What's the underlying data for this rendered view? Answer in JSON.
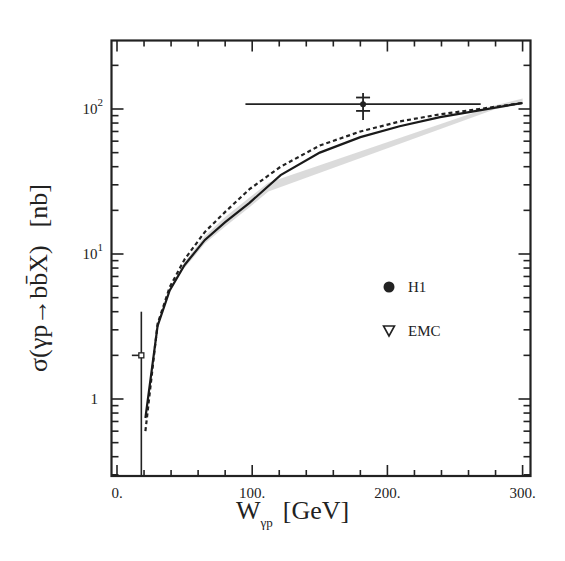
{
  "chart_data": {
    "type": "line",
    "title": "",
    "xlabel": "W_γp [GeV]",
    "xlabel_main": "W",
    "xlabel_sub": "γp",
    "xlabel_unit": "[GeV]",
    "ylabel": "σ(γp→bb̄X) [nb]",
    "ylabel_main": "σ(γp→bb̄X)",
    "ylabel_unit": "[nb]",
    "xlim": [
      -4,
      307
    ],
    "ylim": [
      0.3,
      300
    ],
    "yscale": "log",
    "grid": false,
    "x_ticks": [
      {
        "value": 0,
        "label": "0."
      },
      {
        "value": 100,
        "label": "100."
      },
      {
        "value": 200,
        "label": "200."
      },
      {
        "value": 300,
        "label": "300."
      }
    ],
    "y_ticks": [
      {
        "value": 1,
        "label": "1",
        "exp": ""
      },
      {
        "value": 10,
        "label": "10",
        "exp": "1"
      },
      {
        "value": 100,
        "label": "10",
        "exp": "2"
      }
    ],
    "legend": {
      "position": "lower right inside",
      "entries": [
        {
          "label": "H1",
          "marker": "filled-circle"
        },
        {
          "label": "EMC",
          "marker": "open-triangle-down"
        }
      ]
    },
    "series": [
      {
        "name": "theory (solid)",
        "style": "solid",
        "x": [
          21,
          30,
          39,
          50,
          65,
          80,
          98,
          121,
          150,
          180,
          209,
          239,
          268,
          300
        ],
        "y": [
          0.74,
          3.2,
          5.6,
          8.4,
          12.5,
          16.6,
          22.5,
          35,
          50,
          64,
          76,
          88,
          98,
          110
        ]
      },
      {
        "name": "theory (dashed)",
        "style": "dashed",
        "x": [
          21,
          30,
          39,
          50,
          65,
          80,
          98,
          121,
          150,
          180,
          209,
          239,
          268,
          300
        ],
        "y": [
          0.6,
          3.3,
          5.9,
          9.2,
          14.2,
          19.5,
          28,
          40,
          56,
          70,
          82,
          92,
          100,
          110
        ]
      },
      {
        "name": "theory uncertainty band (shaded)",
        "style": "band",
        "x": [
          50,
          65,
          80,
          98,
          112,
          280,
          300
        ],
        "y_low": [
          8.0,
          11.8,
          15.5,
          21.0,
          27.0,
          100,
          108
        ],
        "y_high": [
          8.8,
          13.3,
          18.0,
          24.5,
          31.0,
          106,
          118
        ]
      }
    ],
    "points": [
      {
        "name": "H1",
        "marker": "filled-circle",
        "x": 182,
        "y": 108,
        "x_err": [
          95,
          269
        ],
        "y_err_stat": [
          97,
          120
        ],
        "y_err_tot": [
          84,
          129
        ]
      },
      {
        "name": "EMC",
        "marker": "open-triangle-down",
        "x": 18,
        "y": 2.0,
        "x_err": [
          11,
          18
        ],
        "y_err_tot": [
          0.3,
          4.0
        ]
      }
    ]
  }
}
